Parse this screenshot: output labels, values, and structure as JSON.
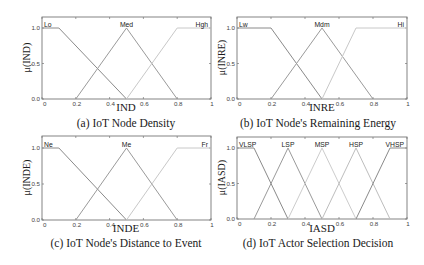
{
  "chart_data": [
    {
      "type": "line",
      "title": "",
      "caption": "(a) IoT Node Density",
      "xlabel": "IND",
      "ylabel": "μ(IND)",
      "xlim": [
        0,
        1
      ],
      "ylim": [
        0,
        1.15
      ],
      "xticks": [
        "0",
        "0.2",
        "0.4",
        "0.6",
        "0.8",
        "1"
      ],
      "yticks": [
        "0.0",
        "0.5",
        "1.0"
      ],
      "grid": false,
      "series": [
        {
          "name": "Lo",
          "x": [
            0,
            0.1,
            0.5
          ],
          "y": [
            1,
            1,
            0
          ],
          "color": "#8a8a8a"
        },
        {
          "name": "Med",
          "x": [
            0.2,
            0.5,
            0.8
          ],
          "y": [
            0,
            1,
            0
          ],
          "color": "#9a9a9a"
        },
        {
          "name": "Hgh",
          "x": [
            0.5,
            0.8,
            1.0
          ],
          "y": [
            0,
            1,
            1
          ],
          "color": "#c8c8c8"
        }
      ]
    },
    {
      "type": "line",
      "title": "",
      "caption": "(b) IoT Node's Remaining Energy",
      "xlabel": "INRE",
      "ylabel": "μ(INRE)",
      "xlim": [
        0,
        1
      ],
      "ylim": [
        0,
        1.15
      ],
      "xticks": [
        "0",
        "0.2",
        "0.4",
        "0.6",
        "0.8",
        "1"
      ],
      "yticks": [
        "0.0",
        "0.5",
        "1.0"
      ],
      "grid": false,
      "series": [
        {
          "name": "Lw",
          "x": [
            0,
            0.2,
            0.5
          ],
          "y": [
            1,
            1,
            0
          ],
          "color": "#8a8a8a"
        },
        {
          "name": "Mdm",
          "x": [
            0.2,
            0.5,
            0.8
          ],
          "y": [
            0,
            1,
            0
          ],
          "color": "#9a9a9a"
        },
        {
          "name": "Hi",
          "x": [
            0.5,
            0.7,
            1.0
          ],
          "y": [
            0,
            1,
            1
          ],
          "color": "#c8c8c8"
        }
      ]
    },
    {
      "type": "line",
      "title": "",
      "caption": "(c) IoT Node's Distance to Event",
      "xlabel": "INDE",
      "ylabel": "μ(INDE)",
      "xlim": [
        0,
        1
      ],
      "ylim": [
        0,
        1.15
      ],
      "xticks": [
        "0",
        "0.2",
        "0.4",
        "0.6",
        "0.8",
        "1"
      ],
      "yticks": [
        "0.0",
        "0.5",
        "1.0"
      ],
      "grid": false,
      "series": [
        {
          "name": "Ne",
          "x": [
            0,
            0.1,
            0.5
          ],
          "y": [
            1,
            1,
            0
          ],
          "color": "#8a8a8a"
        },
        {
          "name": "Me",
          "x": [
            0.2,
            0.5,
            0.8
          ],
          "y": [
            0,
            1,
            0
          ],
          "color": "#9a9a9a"
        },
        {
          "name": "Fr",
          "x": [
            0.5,
            0.8,
            1.0
          ],
          "y": [
            0,
            1,
            1
          ],
          "color": "#c8c8c8"
        }
      ]
    },
    {
      "type": "line",
      "title": "",
      "caption": "(d) IoT Actor Selection Decision",
      "xlabel": "IASD",
      "ylabel": "μ(IASD)",
      "xlim": [
        0,
        1
      ],
      "ylim": [
        0,
        1.15
      ],
      "xticks": [
        "0",
        "0.2",
        "0.4",
        "0.6",
        "0.8",
        "1"
      ],
      "yticks": [
        "0.0",
        "0.5",
        "1.0"
      ],
      "grid": false,
      "series": [
        {
          "name": "VLSP",
          "x": [
            0,
            0.1,
            0.3
          ],
          "y": [
            1,
            1,
            0
          ],
          "color": "#8a8a8a"
        },
        {
          "name": "LSP",
          "x": [
            0.1,
            0.3,
            0.5
          ],
          "y": [
            0,
            1,
            0
          ],
          "color": "#9a9a9a"
        },
        {
          "name": "MSP",
          "x": [
            0.3,
            0.5,
            0.7
          ],
          "y": [
            0,
            1,
            0
          ],
          "color": "#cccccc"
        },
        {
          "name": "HSP",
          "x": [
            0.5,
            0.7,
            0.9
          ],
          "y": [
            0,
            1,
            0
          ],
          "color": "#bdbdbd"
        },
        {
          "name": "VHSP",
          "x": [
            0.7,
            0.9,
            1.0
          ],
          "y": [
            0,
            1,
            1
          ],
          "color": "#8a8a8a"
        }
      ]
    }
  ]
}
